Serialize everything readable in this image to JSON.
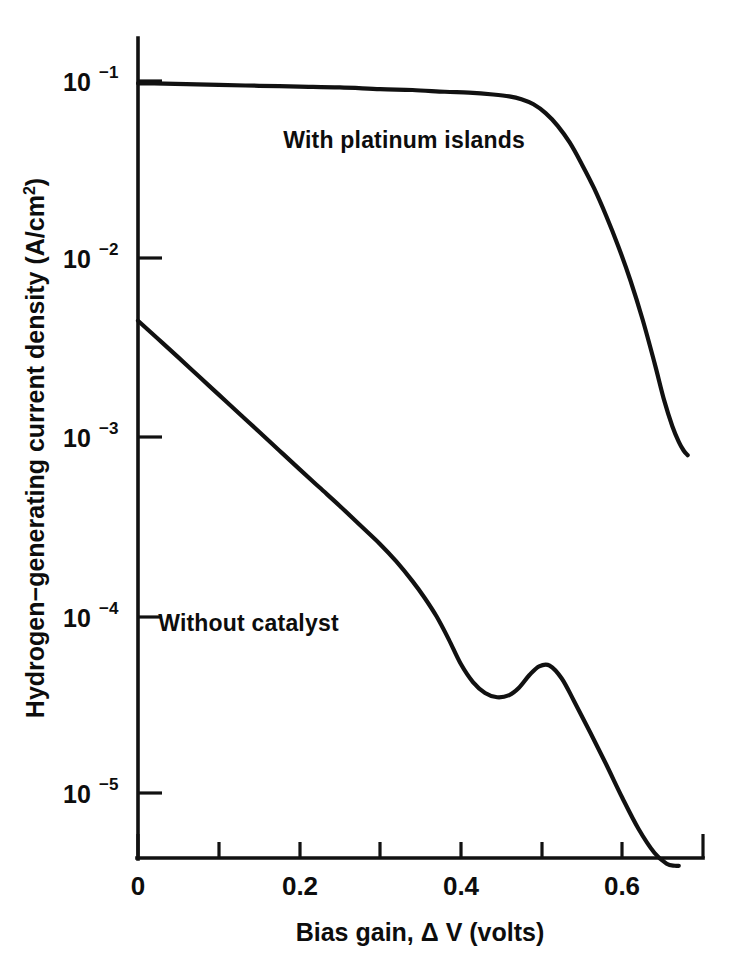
{
  "chart_data": {
    "type": "line",
    "title": "",
    "subtitle": "",
    "xlabel": "Bias gain,  Δ V (volts)",
    "ylabel_main": "Hydrogen−generating current density (A/cm",
    "ylabel_sup": "2",
    "ylabel_tail": ")",
    "ylabel_full": "Hydrogen−generating current density (A/cm2)",
    "xlim": [
      0,
      0.7
    ],
    "ylim": [
      4e-06,
      0.18
    ],
    "yscale": "log",
    "xscale": "linear",
    "grid": false,
    "legend_position": "inline-annotations",
    "x_ticks": [
      0,
      0.1,
      0.2,
      0.3,
      0.4,
      0.5,
      0.6,
      0.7
    ],
    "x_tick_labels": [
      "0",
      "",
      "0.2",
      "",
      "0.4",
      "",
      "0.6",
      ""
    ],
    "y_ticks": [
      0.1,
      0.01,
      0.001,
      0.0001,
      1e-05
    ],
    "y_tick_mantissa": [
      "10",
      "10",
      "10",
      "10",
      "10"
    ],
    "y_tick_exponents": [
      "−1",
      "−2",
      "−3",
      "−4",
      "−5"
    ],
    "series": [
      {
        "name": "With platinum islands",
        "label": "With platinum islands",
        "color": "#111111",
        "x": [
          0.0,
          0.02,
          0.06,
          0.1,
          0.15,
          0.2,
          0.25,
          0.3,
          0.34,
          0.38,
          0.41,
          0.44,
          0.46,
          0.475,
          0.49,
          0.505,
          0.52,
          0.535,
          0.55,
          0.565,
          0.58,
          0.595,
          0.61,
          0.625,
          0.64,
          0.652,
          0.662,
          0.67,
          0.676,
          0.681
        ],
        "y": [
          0.097,
          0.097,
          0.096,
          0.095,
          0.094,
          0.093,
          0.092,
          0.09,
          0.089,
          0.087,
          0.086,
          0.084,
          0.082,
          0.079,
          0.074,
          0.066,
          0.056,
          0.045,
          0.034,
          0.025,
          0.0175,
          0.0118,
          0.0076,
          0.0046,
          0.0026,
          0.0016,
          0.00115,
          0.00094,
          0.00084,
          0.00079
        ]
      },
      {
        "name": "Without catalyst",
        "label": "Without catalyst",
        "color": "#111111",
        "x": [
          0.0,
          0.025,
          0.05,
          0.075,
          0.1,
          0.125,
          0.15,
          0.175,
          0.2,
          0.225,
          0.25,
          0.275,
          0.3,
          0.32,
          0.34,
          0.355,
          0.37,
          0.385,
          0.4,
          0.415,
          0.43,
          0.445,
          0.46,
          0.472,
          0.485,
          0.497,
          0.51,
          0.525,
          0.54,
          0.56,
          0.58,
          0.6,
          0.62,
          0.64,
          0.655,
          0.665,
          0.67
        ],
        "y": [
          0.0045,
          0.00355,
          0.0028,
          0.0022,
          0.00173,
          0.00136,
          0.00107,
          0.00084,
          0.00066,
          0.00052,
          0.00041,
          0.00032,
          0.00025,
          0.0002,
          0.000155,
          0.000125,
          9.8e-05,
          7.3e-05,
          5.3e-05,
          4.2e-05,
          3.65e-05,
          3.45e-05,
          3.55e-05,
          3.9e-05,
          4.6e-05,
          5.15e-05,
          5.2e-05,
          4.4e-05,
          3.3e-05,
          2.2e-05,
          1.45e-05,
          9.4e-06,
          6.3e-06,
          4.6e-06,
          4e-06,
          3.9e-06,
          3.9e-06
        ]
      }
    ],
    "annotations": [
      {
        "text": "With platinum islands",
        "x": 0.18,
        "y": 0.042,
        "name": "annotation-with-platinum-islands"
      },
      {
        "text": "Without catalyst",
        "x": 0.025,
        "y": 8.1e-05,
        "name": "annotation-without-catalyst"
      }
    ]
  },
  "figure": {
    "background_color": "#ffffff",
    "ink_color": "#111111"
  }
}
